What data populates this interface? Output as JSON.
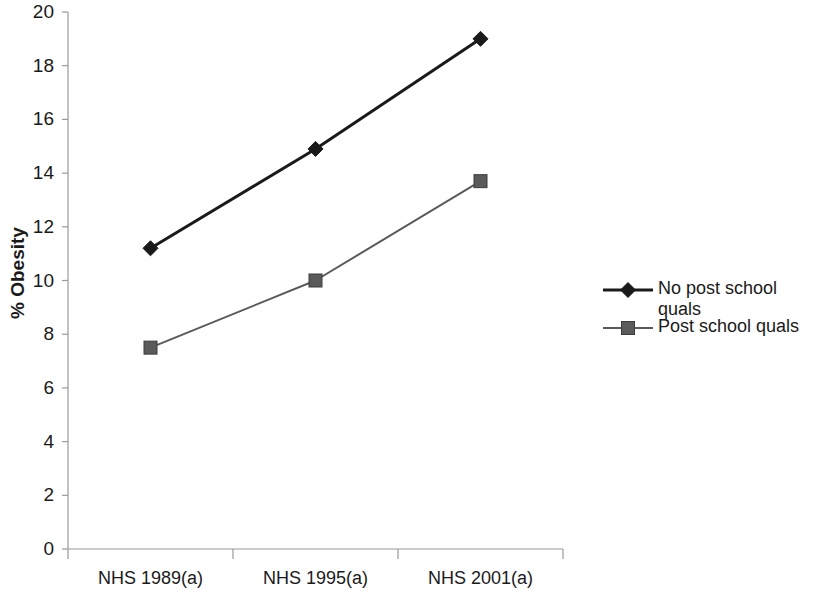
{
  "chart_data": {
    "type": "line",
    "title": "",
    "xlabel": "",
    "ylabel": "% Obesity",
    "categories": [
      "NHS 1989(a)",
      "NHS 1995(a)",
      "NHS 2001(a)"
    ],
    "series": [
      {
        "name": "No post school quals",
        "values": [
          11.2,
          14.9,
          19.0
        ],
        "marker": "diamond",
        "color": "#1a1a1a",
        "line_width": 3
      },
      {
        "name": "Post school quals",
        "values": [
          7.5,
          10.0,
          13.7
        ],
        "marker": "square",
        "color": "#5a5a5a",
        "line_width": 2
      }
    ],
    "ylim": [
      0,
      20
    ],
    "ytick_step": 2,
    "yticks": [
      "0",
      "2",
      "4",
      "6",
      "8",
      "10",
      "12",
      "14",
      "16",
      "18",
      "20"
    ],
    "grid": false,
    "legend_position": "right"
  },
  "legend": {
    "entries": [
      {
        "label": "No post school quals",
        "marker": "diamond-marker"
      },
      {
        "label": "Post school quals",
        "marker": "square-marker"
      }
    ]
  },
  "axis": {
    "y_title": "% Obesity"
  },
  "colors": {
    "series_1": "#1a1a1a",
    "series_2": "#5a5a5a",
    "axis": "#9a9a9a",
    "text": "#1a1a1a",
    "background": "#ffffff"
  }
}
